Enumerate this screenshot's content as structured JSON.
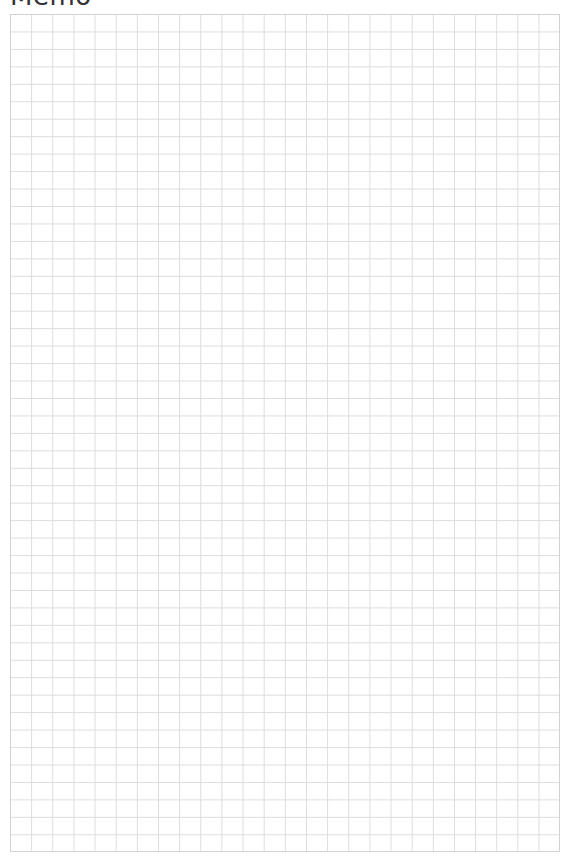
{
  "title": "Memo",
  "grid": {
    "columns": 26,
    "rows": 48,
    "line_color": "#dcdcdc",
    "background": "#ffffff"
  }
}
